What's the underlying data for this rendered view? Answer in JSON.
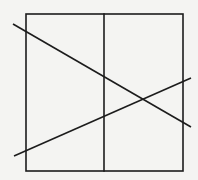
{
  "diagram": {
    "background": "#f4f4f2",
    "stroke_color": "#1c1c1c",
    "stroke_width": 1.6,
    "square": {
      "x1": 26,
      "y1": 14,
      "x2": 183,
      "y2": 171
    },
    "vertical_divider": {
      "x": 104,
      "y1": 14,
      "y2": 171
    },
    "lines": [
      {
        "name": "descending-diagonal",
        "x1": 13,
        "y1": 24,
        "x2": 191,
        "y2": 127
      },
      {
        "name": "ascending-diagonal",
        "x1": 14,
        "y1": 156,
        "x2": 191,
        "y2": 78
      }
    ]
  }
}
